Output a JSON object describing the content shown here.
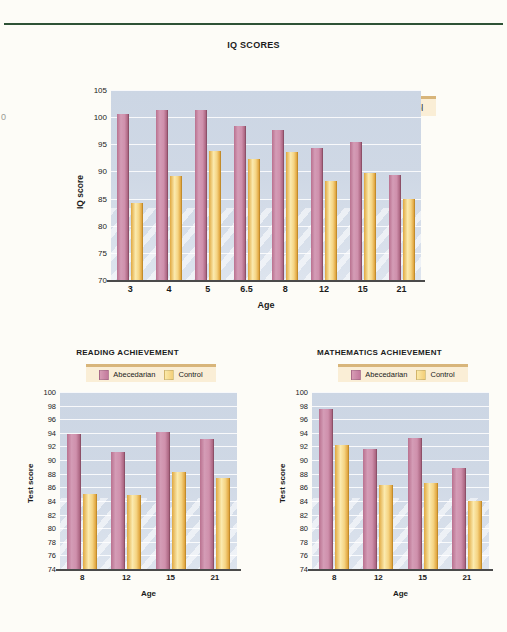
{
  "page": {
    "background": "#fdfcf7",
    "rule_color": "#2e5236",
    "edge_mark": "0"
  },
  "palette": {
    "abecedarian": "#c8849f",
    "control": "#f0c873",
    "plot_background": "#ccd6e4",
    "legend_background": "#faeed6",
    "legend_border": "#d8b57a",
    "axis": "#4a4a4a"
  },
  "legend": {
    "abecedarian_label": "Abecedarian",
    "control_label": "Control"
  },
  "chart_data": [
    {
      "id": "iq",
      "type": "bar",
      "title": "IQ SCORES",
      "xlabel": "Age",
      "ylabel": "IQ score",
      "categories": [
        "3",
        "4",
        "5",
        "6.5",
        "8",
        "12",
        "15",
        "21"
      ],
      "ylim": [
        70,
        105
      ],
      "yticks": [
        70,
        75,
        80,
        85,
        90,
        95,
        100,
        105
      ],
      "grid": true,
      "legend_position": "top-right",
      "series": [
        {
          "name": "Abecedarian",
          "color": "#c8849f",
          "values": [
            100.5,
            101.4,
            101.3,
            98.3,
            97.6,
            94.4,
            95.5,
            89.3
          ]
        },
        {
          "name": "Control",
          "color": "#f0c873",
          "values": [
            84.2,
            89.1,
            93.7,
            92.3,
            93.5,
            88.3,
            89.8,
            85.0
          ]
        }
      ]
    },
    {
      "id": "reading",
      "type": "bar",
      "title": "READING ACHIEVEMENT",
      "xlabel": "Age",
      "ylabel": "Test score",
      "categories": [
        "8",
        "12",
        "15",
        "21"
      ],
      "ylim": [
        74,
        100
      ],
      "yticks": [
        74,
        76,
        78,
        80,
        82,
        84,
        86,
        88,
        90,
        92,
        94,
        96,
        98,
        100
      ],
      "grid": true,
      "legend_position": "top-right",
      "series": [
        {
          "name": "Abecedarian",
          "color": "#c8849f",
          "values": [
            93.8,
            91.2,
            94.1,
            93.1
          ]
        },
        {
          "name": "Control",
          "color": "#f0c873",
          "values": [
            85.0,
            84.9,
            88.2,
            87.3
          ]
        }
      ]
    },
    {
      "id": "math",
      "type": "bar",
      "title": "MATHEMATICS ACHIEVEMENT",
      "xlabel": "Age",
      "ylabel": "Test score",
      "categories": [
        "8",
        "12",
        "15",
        "21"
      ],
      "ylim": [
        74,
        100
      ],
      "yticks": [
        74,
        76,
        78,
        80,
        82,
        84,
        86,
        88,
        90,
        92,
        94,
        96,
        98,
        100
      ],
      "grid": true,
      "legend_position": "top-right",
      "series": [
        {
          "name": "Abecedarian",
          "color": "#c8849f",
          "values": [
            97.5,
            91.7,
            93.3,
            88.8
          ]
        },
        {
          "name": "Control",
          "color": "#f0c873",
          "values": [
            92.2,
            86.3,
            86.6,
            84.0
          ]
        }
      ]
    }
  ]
}
